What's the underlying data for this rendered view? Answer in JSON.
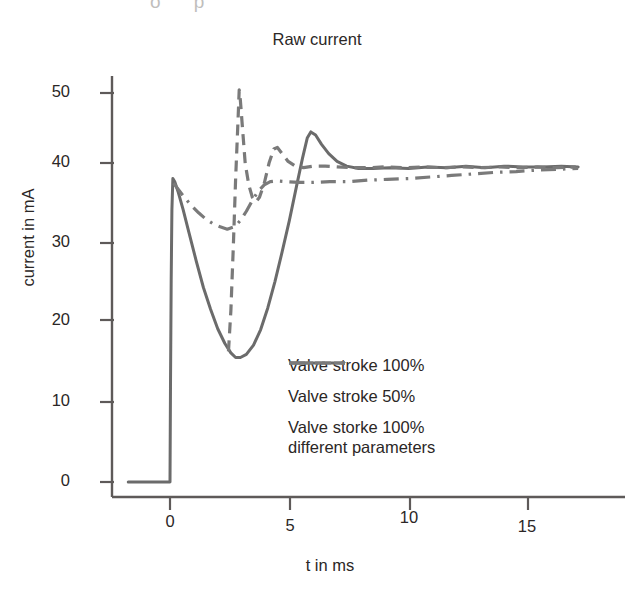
{
  "chart_data": {
    "type": "line",
    "title": "Raw current",
    "xlabel": "t in ms",
    "ylabel": "current in mA",
    "xlim": [
      -1.9,
      17.5
    ],
    "ylim": [
      -2,
      53
    ],
    "xticks": [
      "0",
      "5",
      "10",
      "15"
    ],
    "xtick_values": [
      0,
      5,
      10,
      15
    ],
    "yticks": [
      "0",
      "10",
      "20",
      "30",
      "40",
      "50"
    ],
    "ytick_values": [
      0,
      10,
      20,
      30,
      40,
      50
    ],
    "grid": false,
    "legend_position": "center-right-lower",
    "series": [
      {
        "name": "Valve stroke 100%",
        "style": "solid",
        "color": "#6b6b6b",
        "points": [
          [
            -1.75,
            0.0
          ],
          [
            -1.2,
            0.0
          ],
          [
            -0.6,
            0.0
          ],
          [
            -0.1,
            0.0
          ],
          [
            0.0,
            0.0
          ],
          [
            0.02,
            12.0
          ],
          [
            0.05,
            26.0
          ],
          [
            0.08,
            35.0
          ],
          [
            0.12,
            39.0
          ],
          [
            0.2,
            38.6
          ],
          [
            0.35,
            37.2
          ],
          [
            0.55,
            35.0
          ],
          [
            0.8,
            32.0
          ],
          [
            1.1,
            28.4
          ],
          [
            1.4,
            25.0
          ],
          [
            1.7,
            22.2
          ],
          [
            2.0,
            19.7
          ],
          [
            2.3,
            17.8
          ],
          [
            2.55,
            16.6
          ],
          [
            2.75,
            16.0
          ],
          [
            2.95,
            16.0
          ],
          [
            3.2,
            16.4
          ],
          [
            3.5,
            17.6
          ],
          [
            3.8,
            19.6
          ],
          [
            4.1,
            22.4
          ],
          [
            4.4,
            25.8
          ],
          [
            4.7,
            29.6
          ],
          [
            5.0,
            33.6
          ],
          [
            5.3,
            38.0
          ],
          [
            5.55,
            41.6
          ],
          [
            5.75,
            44.2
          ],
          [
            5.9,
            45.0
          ],
          [
            6.1,
            44.6
          ],
          [
            6.35,
            43.4
          ],
          [
            6.65,
            42.2
          ],
          [
            7.0,
            41.2
          ],
          [
            7.4,
            40.6
          ],
          [
            7.9,
            40.3
          ],
          [
            8.5,
            40.3
          ],
          [
            9.2,
            40.4
          ],
          [
            10.0,
            40.3
          ],
          [
            10.8,
            40.5
          ],
          [
            11.6,
            40.4
          ],
          [
            12.4,
            40.6
          ],
          [
            13.2,
            40.4
          ],
          [
            14.0,
            40.6
          ],
          [
            14.8,
            40.5
          ],
          [
            15.6,
            40.5
          ],
          [
            16.4,
            40.6
          ],
          [
            17.1,
            40.5
          ]
        ]
      },
      {
        "name": "Valve stroke 50%",
        "style": "dashed",
        "color": "#7a7a7a",
        "points": [
          [
            2.45,
            16.8
          ],
          [
            2.55,
            22.0
          ],
          [
            2.65,
            30.0
          ],
          [
            2.75,
            39.0
          ],
          [
            2.85,
            46.5
          ],
          [
            2.9,
            50.4
          ],
          [
            2.95,
            49.0
          ],
          [
            3.05,
            45.0
          ],
          [
            3.15,
            41.0
          ],
          [
            3.3,
            38.2
          ],
          [
            3.45,
            36.6
          ],
          [
            3.6,
            36.0
          ],
          [
            3.75,
            36.6
          ],
          [
            3.95,
            38.4
          ],
          [
            4.15,
            41.0
          ],
          [
            4.35,
            42.8
          ],
          [
            4.5,
            43.0
          ],
          [
            4.7,
            42.2
          ],
          [
            4.95,
            41.2
          ],
          [
            5.25,
            40.6
          ],
          [
            5.6,
            40.4
          ],
          [
            6.0,
            40.6
          ],
          [
            6.5,
            40.6
          ],
          [
            7.0,
            40.5
          ],
          [
            7.6,
            40.4
          ],
          [
            8.3,
            40.4
          ],
          [
            9.0,
            40.5
          ],
          [
            9.8,
            40.4
          ],
          [
            10.6,
            40.5
          ],
          [
            11.4,
            40.4
          ],
          [
            12.2,
            40.5
          ],
          [
            13.0,
            40.4
          ],
          [
            13.8,
            40.5
          ],
          [
            14.6,
            40.4
          ],
          [
            15.4,
            40.5
          ],
          [
            16.2,
            40.4
          ],
          [
            17.0,
            40.5
          ]
        ]
      },
      {
        "name_line1": "Valve storke 100%",
        "name_line2": "different parameters",
        "style": "dashdot",
        "color": "#7a7a7a",
        "points": [
          [
            0.15,
            38.4
          ],
          [
            0.35,
            37.6
          ],
          [
            0.6,
            36.6
          ],
          [
            0.9,
            35.5
          ],
          [
            1.2,
            34.6
          ],
          [
            1.5,
            33.8
          ],
          [
            1.8,
            33.2
          ],
          [
            2.1,
            32.8
          ],
          [
            2.4,
            32.5
          ],
          [
            2.7,
            32.8
          ],
          [
            2.95,
            33.6
          ],
          [
            3.2,
            34.8
          ],
          [
            3.45,
            36.2
          ],
          [
            3.7,
            37.4
          ],
          [
            3.95,
            38.2
          ],
          [
            4.2,
            38.6
          ],
          [
            4.5,
            38.7
          ],
          [
            4.9,
            38.6
          ],
          [
            5.4,
            38.5
          ],
          [
            6.0,
            38.5
          ],
          [
            6.7,
            38.6
          ],
          [
            7.5,
            38.6
          ],
          [
            8.3,
            38.8
          ],
          [
            9.1,
            38.9
          ],
          [
            10.0,
            39.0
          ],
          [
            10.9,
            39.2
          ],
          [
            11.8,
            39.4
          ],
          [
            12.7,
            39.6
          ],
          [
            13.6,
            39.8
          ],
          [
            14.5,
            39.9
          ],
          [
            15.4,
            40.1
          ],
          [
            16.3,
            40.2
          ],
          [
            17.1,
            40.3
          ]
        ]
      }
    ]
  },
  "artifacts": {
    "top_scrap": "o p"
  }
}
